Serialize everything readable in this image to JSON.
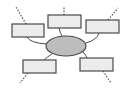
{
  "diagram": {
    "type": "spider-map",
    "colors": {
      "background": "#ffffff",
      "box_fill": "#ececec",
      "box_stroke": "#4a4a4a",
      "ellipse_fill": "#bdbdbd",
      "ellipse_stroke": "#4a4a4a",
      "connector": "#4a4a4a",
      "dotted": "#555555"
    },
    "center": {
      "label": "",
      "cx": 66,
      "cy": 46,
      "rx": 20,
      "ry": 10
    },
    "branches": [
      {
        "id": "top-left",
        "label": "",
        "x": 12,
        "y": 24,
        "w": 32,
        "h": 13
      },
      {
        "id": "top-center",
        "label": "",
        "x": 48,
        "y": 15,
        "w": 33,
        "h": 13
      },
      {
        "id": "top-right",
        "label": "",
        "x": 86,
        "y": 20,
        "w": 33,
        "h": 13
      },
      {
        "id": "bottom-left",
        "label": "",
        "x": 23,
        "y": 60,
        "w": 33,
        "h": 13
      },
      {
        "id": "bottom-right",
        "label": "",
        "x": 80,
        "y": 58,
        "w": 33,
        "h": 13
      }
    ]
  }
}
